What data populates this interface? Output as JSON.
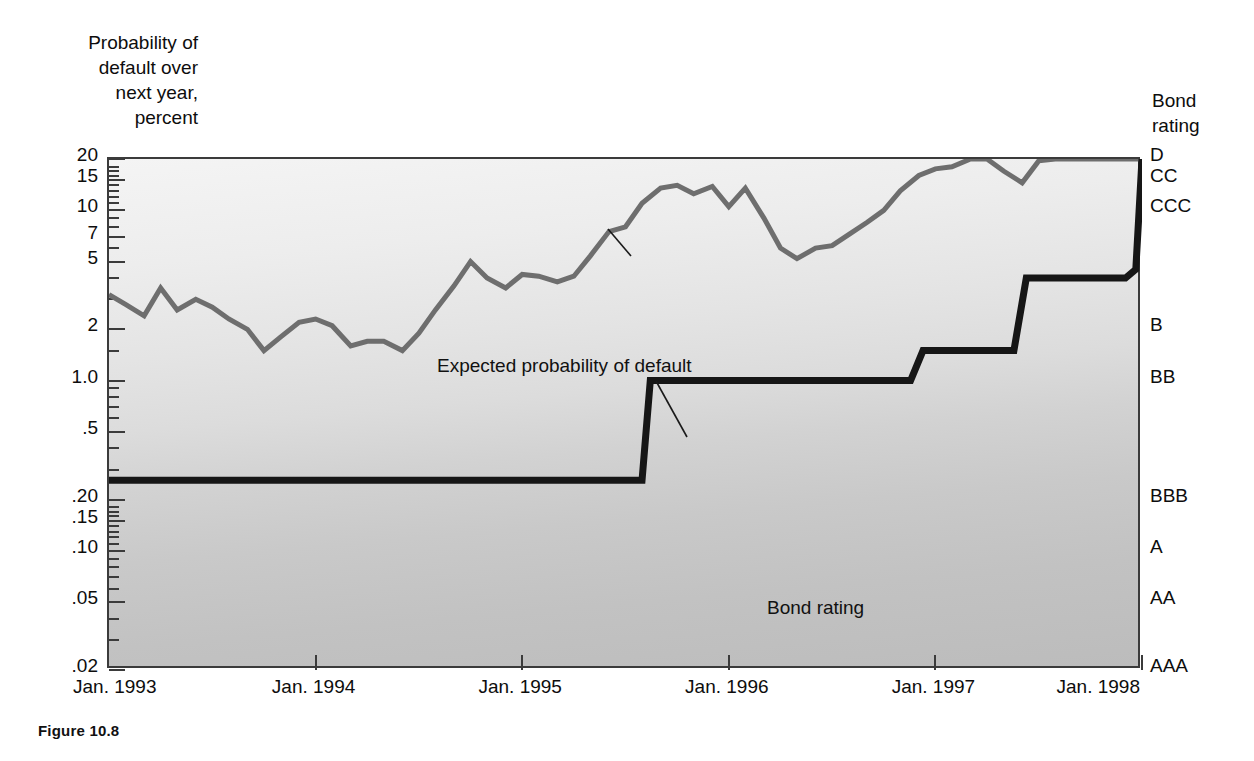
{
  "figure": {
    "caption": "Figure 10.8"
  },
  "axes": {
    "y_title": "Probability of\ndefault over\nnext year,\npercent",
    "right_title": "Bond\nrating",
    "y_ticks_major": [
      "20",
      "15",
      "10",
      "7",
      "5",
      "2",
      "1.0",
      ".5",
      ".20",
      ".15",
      ".10",
      ".05",
      ".02"
    ],
    "x_ticks": [
      "Jan. 1993",
      "Jan. 1994",
      "Jan. 1995",
      "Jan. 1996",
      "Jan. 1997",
      "Jan. 1998"
    ],
    "rating_labels": [
      "D",
      "CC",
      "CCC",
      "B",
      "BB",
      "BBB",
      "A",
      "AA",
      "AAA"
    ]
  },
  "annotations": {
    "default_line": "Expected probability of default",
    "rating_line": "Bond rating"
  },
  "colors": {
    "expected_default_line": "#6e6e6e",
    "bond_rating_line": "#161616",
    "frame": "#3b3b3b",
    "plot_background_top": "#f4f4f4",
    "plot_background_bottom": "#bcbcbc"
  },
  "chart_data": {
    "type": "line",
    "title": "Figure 10.8",
    "xlabel": "",
    "ylabel": "Probability of default over next year, percent",
    "y_scale": "log",
    "ylim": [
      0.02,
      20
    ],
    "xlim": [
      "Jan. 1993",
      "Jan. 1998"
    ],
    "grid": false,
    "legend": "inline-annotations",
    "y_tick_values": [
      20,
      15,
      10,
      7,
      5,
      2,
      1.0,
      0.5,
      0.2,
      0.15,
      0.1,
      0.05,
      0.02
    ],
    "y_tick_labels": [
      "20",
      "15",
      "10",
      "7",
      "5",
      "2",
      "1.0",
      ".5",
      ".20",
      ".15",
      ".10",
      ".05",
      ".02"
    ],
    "x_tick_values": [
      1993.0,
      1994.0,
      1995.0,
      1996.0,
      1997.0,
      1998.0
    ],
    "x_tick_labels": [
      "Jan. 1993",
      "Jan. 1994",
      "Jan. 1995",
      "Jan. 1996",
      "Jan. 1997",
      "Jan. 1998"
    ],
    "right_axis": {
      "label": "Bond rating",
      "categories": [
        "AAA",
        "AA",
        "A",
        "BBB",
        "BB",
        "B",
        "CCC",
        "CC",
        "D"
      ],
      "mapped_probability": [
        0.02,
        0.05,
        0.1,
        0.2,
        1.0,
        2.0,
        10.0,
        15.0,
        20.0
      ]
    },
    "series": [
      {
        "name": "Expected probability of default",
        "color": "#6e6e6e",
        "x": [
          1993.0,
          1993.08,
          1993.17,
          1993.25,
          1993.33,
          1993.42,
          1993.5,
          1993.58,
          1993.67,
          1993.75,
          1993.83,
          1993.92,
          1994.0,
          1994.08,
          1994.17,
          1994.25,
          1994.33,
          1994.42,
          1994.5,
          1994.58,
          1994.67,
          1994.75,
          1994.83,
          1994.92,
          1995.0,
          1995.08,
          1995.17,
          1995.25,
          1995.33,
          1995.42,
          1995.5,
          1995.58,
          1995.67,
          1995.75,
          1995.83,
          1995.92,
          1996.0,
          1996.08,
          1996.17,
          1996.25,
          1996.33,
          1996.42,
          1996.5,
          1996.58,
          1996.67,
          1996.75,
          1996.83,
          1996.92,
          1997.0,
          1997.08,
          1997.17,
          1997.25,
          1997.33,
          1997.42,
          1997.5,
          1997.58,
          1997.67,
          1997.75,
          1997.83,
          1997.92,
          1998.0
        ],
        "y": [
          3.2,
          2.8,
          2.4,
          3.5,
          2.6,
          3.0,
          2.7,
          2.3,
          2.0,
          1.5,
          1.8,
          2.2,
          2.3,
          2.1,
          1.6,
          1.7,
          1.7,
          1.5,
          1.9,
          2.6,
          3.6,
          5.0,
          4.0,
          3.5,
          4.2,
          4.1,
          3.8,
          4.1,
          5.4,
          7.5,
          8.0,
          11.0,
          13.5,
          14.0,
          12.5,
          13.8,
          10.5,
          13.5,
          9.0,
          6.0,
          5.2,
          6.0,
          6.2,
          7.2,
          8.5,
          10.0,
          13.0,
          16.0,
          17.5,
          18.0,
          20.0,
          20.0,
          17.0,
          14.5,
          19.5,
          20.5,
          20.5,
          20.5,
          20.5,
          20.5,
          20.5
        ]
      },
      {
        "name": "Bond rating",
        "color": "#161616",
        "step": true,
        "x": [
          1993.0,
          1995.58,
          1995.62,
          1996.88,
          1996.94,
          1997.38,
          1997.44,
          1997.92,
          1997.97,
          1998.0
        ],
        "y": [
          0.26,
          0.26,
          1.0,
          1.0,
          1.5,
          1.5,
          4.0,
          4.0,
          4.5,
          20.0
        ],
        "rating_sequence": [
          "BBB",
          "BBB",
          "BB",
          "BB",
          "BB+",
          "BB+",
          "B",
          "B",
          "B",
          "D"
        ]
      }
    ]
  }
}
